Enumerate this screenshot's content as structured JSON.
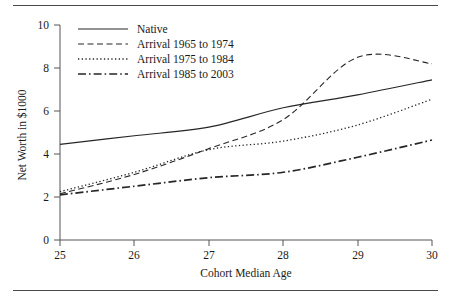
{
  "chart_data": {
    "type": "line",
    "title": "",
    "xlabel": "Cohort Median Age",
    "ylabel": "Net Worth in $1000",
    "x": [
      25,
      26,
      27,
      28,
      29,
      30
    ],
    "xlim": [
      25,
      30
    ],
    "ylim": [
      0,
      10
    ],
    "xticks": [
      "25",
      "26",
      "27",
      "28",
      "29",
      "30"
    ],
    "yticks": [
      "0",
      "2",
      "4",
      "6",
      "8",
      "10"
    ],
    "grid": false,
    "legend_position": "top-left",
    "series": [
      {
        "name": "Native",
        "style": "solid",
        "values": [
          4.45,
          4.85,
          5.25,
          6.15,
          6.75,
          7.45
        ]
      },
      {
        "name": "Arrival 1965 to 1974",
        "style": "dashed",
        "values": [
          2.15,
          3.05,
          4.25,
          5.6,
          8.5,
          8.2
        ]
      },
      {
        "name": "Arrival 1975 to 1984",
        "style": "dotted",
        "values": [
          2.25,
          3.15,
          4.2,
          4.6,
          5.35,
          6.55
        ]
      },
      {
        "name": "Arrival 1985 to 2003",
        "style": "dashdot",
        "values": [
          2.1,
          2.5,
          2.9,
          3.15,
          3.85,
          4.65
        ]
      }
    ]
  },
  "legend": {
    "items": [
      {
        "label": "Native"
      },
      {
        "label": "Arrival 1965 to 1974"
      },
      {
        "label": "Arrival 1975 to 1984"
      },
      {
        "label": "Arrival 1985 to 2003"
      }
    ]
  }
}
